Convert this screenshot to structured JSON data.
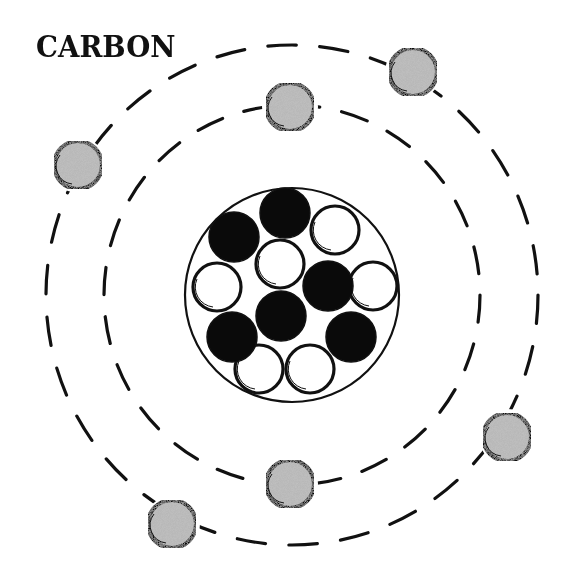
{
  "title": "CARBON",
  "colors": {
    "ink": "#111111",
    "electron_fill": "#b8b8b8",
    "neutron_fill": "#ffffff",
    "proton_fill": "#0a0a0a",
    "background": "#ffffff"
  },
  "nucleus": {
    "center": [
      292,
      295
    ],
    "radius": 107,
    "particle_radius": 25,
    "protons": [
      {
        "x": 234,
        "y": 237
      },
      {
        "x": 285,
        "y": 213
      },
      {
        "x": 328,
        "y": 286
      },
      {
        "x": 281,
        "y": 316
      },
      {
        "x": 232,
        "y": 337
      },
      {
        "x": 351,
        "y": 337
      }
    ],
    "neutrons": [
      {
        "x": 335,
        "y": 230
      },
      {
        "x": 217,
        "y": 287
      },
      {
        "x": 280,
        "y": 264
      },
      {
        "x": 373,
        "y": 286
      },
      {
        "x": 259,
        "y": 369
      },
      {
        "x": 310,
        "y": 369
      }
    ],
    "proton_count": 6,
    "neutron_count": 6
  },
  "orbits": [
    {
      "name": "inner",
      "cx": 292,
      "cy": 295,
      "rx": 188,
      "ry": 190
    },
    {
      "name": "outer",
      "cx": 292,
      "cy": 295,
      "rx": 246,
      "ry": 250
    }
  ],
  "electrons": [
    {
      "orbit": "inner",
      "x": 290,
      "y": 107
    },
    {
      "orbit": "inner",
      "x": 290,
      "y": 484
    },
    {
      "orbit": "outer",
      "x": 413,
      "y": 72
    },
    {
      "orbit": "outer",
      "x": 78,
      "y": 165
    },
    {
      "orbit": "outer",
      "x": 507,
      "y": 437
    },
    {
      "orbit": "outer",
      "x": 172,
      "y": 524
    }
  ],
  "electron_radius": 24
}
